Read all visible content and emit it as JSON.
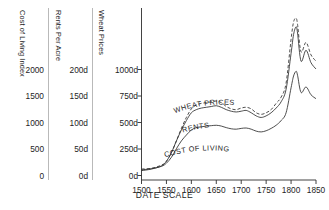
{
  "chart_data": {
    "type": "line",
    "title": "",
    "xlabel": "DATE SCALE",
    "ylabel": "",
    "grid": false,
    "legend_position": "inline-on-curves",
    "xlim": [
      1500,
      1850
    ],
    "x_ticks": [
      1500,
      1550,
      1600,
      1650,
      1700,
      1750,
      1800,
      1850
    ],
    "axes": [
      {
        "name": "cost-of-living",
        "header": "Cost of Living Index",
        "ticks": [
          "0",
          "500",
          "1000",
          "1500",
          "2000"
        ],
        "tick_values": [
          0,
          500,
          1000,
          1500,
          2000
        ],
        "ylim": [
          0,
          2200
        ]
      },
      {
        "name": "rents-per-acre",
        "header": "Rents Per Acre",
        "ticks": [
          "0d",
          "50d",
          "100d",
          "150d",
          "200d"
        ],
        "tick_values": [
          0,
          50,
          100,
          150,
          200
        ],
        "ylim": [
          0,
          220
        ]
      },
      {
        "name": "wheat-prices",
        "header": "Wheat Prices",
        "ticks": [
          "0d",
          "250d",
          "500d",
          "750d",
          "1000d"
        ],
        "tick_values": [
          0,
          250,
          500,
          750,
          1000
        ],
        "ylim": [
          0,
          1100
        ]
      }
    ],
    "series": [
      {
        "name": "WHEAT PRICES",
        "label": "WHEAT PRICES",
        "axis": "wheat-prices",
        "style": "dashed",
        "x": [
          1500,
          1520,
          1540,
          1550,
          1560,
          1570,
          1580,
          1590,
          1600,
          1610,
          1620,
          1630,
          1640,
          1650,
          1660,
          1670,
          1680,
          1690,
          1700,
          1710,
          1720,
          1730,
          1740,
          1750,
          1760,
          1770,
          1780,
          1790,
          1800,
          1805,
          1810,
          1813,
          1820,
          1830,
          1840,
          1850
        ],
        "values": [
          70,
          75,
          95,
          120,
          175,
          250,
          330,
          400,
          455,
          480,
          490,
          495,
          500,
          505,
          495,
          470,
          455,
          450,
          460,
          465,
          455,
          430,
          420,
          430,
          450,
          490,
          530,
          620,
          900,
          1010,
          1035,
          995,
          820,
          880,
          800,
          760
        ]
      },
      {
        "name": "RENTS",
        "label": "RENTS",
        "axis": "rents-per-acre",
        "style": "solid",
        "x": [
          1500,
          1520,
          1540,
          1550,
          1560,
          1570,
          1580,
          1590,
          1600,
          1610,
          1620,
          1630,
          1640,
          1650,
          1660,
          1670,
          1680,
          1690,
          1700,
          1710,
          1720,
          1730,
          1740,
          1750,
          1760,
          1770,
          1780,
          1790,
          1800,
          1805,
          1810,
          1813,
          1820,
          1830,
          1840,
          1850
        ],
        "values": [
          12,
          14,
          18,
          24,
          35,
          50,
          64,
          76,
          86,
          90,
          92,
          93,
          94,
          95,
          93,
          90,
          88,
          87,
          88,
          89,
          86,
          82,
          80,
          82,
          86,
          92,
          100,
          116,
          162,
          186,
          196,
          188,
          152,
          166,
          150,
          142
        ]
      },
      {
        "name": "COST OF LIVING",
        "label": "COST OF LIVING",
        "axis": "cost-of-living",
        "style": "solid",
        "x": [
          1500,
          1520,
          1540,
          1550,
          1560,
          1570,
          1580,
          1590,
          1600,
          1610,
          1620,
          1630,
          1640,
          1650,
          1660,
          1670,
          1680,
          1690,
          1700,
          1710,
          1720,
          1730,
          1740,
          1750,
          1760,
          1770,
          1780,
          1790,
          1800,
          1805,
          1810,
          1813,
          1820,
          1830,
          1840,
          1850
        ],
        "values": [
          130,
          145,
          175,
          215,
          290,
          400,
          500,
          575,
          640,
          670,
          680,
          690,
          695,
          700,
          690,
          670,
          655,
          650,
          660,
          665,
          650,
          625,
          615,
          630,
          660,
          700,
          760,
          860,
          1180,
          1330,
          1390,
          1340,
          1120,
          1190,
          1090,
          1040
        ]
      }
    ]
  },
  "x_axis": {
    "label": "DATE SCALE",
    "ticks": [
      "1500",
      "1550",
      "1600",
      "1650",
      "1700",
      "1750",
      "1800",
      "1850"
    ]
  }
}
